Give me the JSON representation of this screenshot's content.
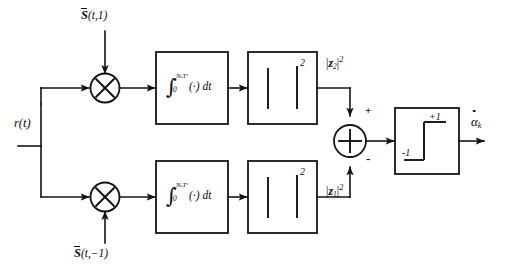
{
  "diagram": {
    "type": "signal-flow-block-diagram",
    "background_color": "#ffffff",
    "line_color": "#141414",
    "width": 507,
    "height": 270
  },
  "inputs": {
    "received_signal": {
      "label_base": "r",
      "label_args": "(t)",
      "full": "r(t)",
      "description": "received signal input"
    },
    "reference_upper": {
      "overline_symbol": "S",
      "args": "(t,1)",
      "full": "S̄(t,1)",
      "description": "upper branch reference waveform"
    },
    "reference_lower": {
      "overline_symbol": "S",
      "args": "(t,−1)",
      "full": "S̄(t,−1)",
      "description": "lower branch reference waveform"
    }
  },
  "blocks": {
    "multiplier_upper": {
      "symbol": "⊗",
      "name": "multiplier",
      "branch": "upper"
    },
    "multiplier_lower": {
      "symbol": "⊗",
      "name": "multiplier",
      "branch": "lower"
    },
    "integrator_upper": {
      "integral_symbol": "∫",
      "lower_limit": "0",
      "upper_limit": "NₛTᶜ",
      "upper_limit_plain": "N,T",
      "body": "(·) dt",
      "full": "∫₀^{NₛTᶜ} (·) dt"
    },
    "integrator_lower": {
      "integral_symbol": "∫",
      "lower_limit": "0",
      "upper_limit": "NₛTᶜ",
      "upper_limit_plain": "N,T",
      "body": "(·) dt",
      "full": "∫₀^{NₛTᶜ} (·) dt"
    },
    "magnitude_squared_upper": {
      "glyph": "| |",
      "exponent": "2",
      "full": "| |²"
    },
    "magnitude_squared_lower": {
      "glyph": "| |",
      "exponent": "2",
      "full": "| |²"
    },
    "summing_junction": {
      "symbol": "+",
      "plus_sign": "+",
      "minus_sign": "-",
      "plus_input": "upper",
      "minus_input": "lower"
    },
    "decision_device": {
      "name": "signum / step decision",
      "high_level": "+1",
      "low_level": "-1"
    }
  },
  "signals": {
    "z_upper": {
      "magnitude": "z",
      "subscript": "2",
      "superscript": "2",
      "full": "|z₂|²"
    },
    "z_lower": {
      "magnitude": "z",
      "subscript": "1",
      "superscript": "2",
      "full": "|z₁|²"
    }
  },
  "output": {
    "symbol": "α",
    "accent": "dot",
    "subscript": "k",
    "full": "α̇ₖ",
    "description": "decision output estimate"
  }
}
